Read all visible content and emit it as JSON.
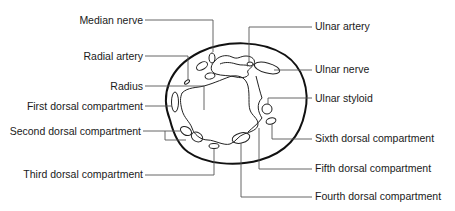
{
  "figure": {
    "type": "anatomical cross-section"
  },
  "labels": {
    "left": [
      {
        "id": "median_nerve",
        "text": "Median nerve"
      },
      {
        "id": "radial_artery",
        "text": "Radial artery"
      },
      {
        "id": "radius",
        "text": "Radius"
      },
      {
        "id": "first_dorsal",
        "text": "First dorsal compartment"
      },
      {
        "id": "second_dorsal",
        "text": "Second dorsal compartment"
      },
      {
        "id": "third_dorsal",
        "text": "Third dorsal compartment"
      }
    ],
    "right": [
      {
        "id": "ulnar_artery",
        "text": "Ulnar artery"
      },
      {
        "id": "ulnar_nerve",
        "text": "Ulnar nerve"
      },
      {
        "id": "ulnar_styloid",
        "text": "Ulnar styloid"
      },
      {
        "id": "sixth_dorsal",
        "text": "Sixth dorsal compartment"
      },
      {
        "id": "fifth_dorsal",
        "text": "Fifth dorsal compartment"
      },
      {
        "id": "fourth_dorsal",
        "text": "Fourth dorsal compartment"
      }
    ]
  },
  "colors": {
    "outline": "#111111",
    "leader": "#555555",
    "text": "#1a1a1a",
    "background": "#ffffff"
  }
}
